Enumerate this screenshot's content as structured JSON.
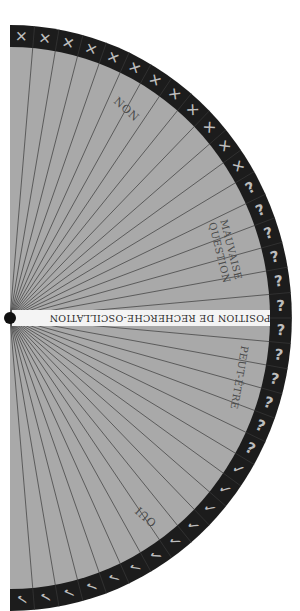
{
  "geometry": {
    "center_x": 10,
    "center_y": 318,
    "outer_rx": 282,
    "outer_ry": 293,
    "band_width": 22,
    "segments": 36
  },
  "colors": {
    "face": "#a9a9a9",
    "band": "#1c1c1c",
    "ray": "#3a3a3a",
    "symbol": "#bdbdbd",
    "strip": "#f4f4f4",
    "pivot": "#111111",
    "label": "#4a4a4a"
  },
  "zones": [
    {
      "name": "non",
      "symbol": "✕",
      "symbol_name": "x-icon",
      "count": 12
    },
    {
      "name": "mauvaise-question",
      "symbol": "?",
      "symbol_name": "question-mark-icon",
      "count": 6
    },
    {
      "name": "peut-etre",
      "symbol": "?",
      "symbol_name": "question-mark-icon",
      "count": 6
    },
    {
      "name": "oui",
      "symbol": "✓",
      "symbol_name": "check-icon",
      "count": 12
    }
  ],
  "labels": {
    "non": "NON",
    "mauvaise_line1": "MAUVAISE",
    "mauvaise_line2": "QUESTION",
    "peut_etre": "PEUT-ÊTRE",
    "oui": "OUI"
  },
  "strip": {
    "text": "POSITION  DE  RECHERCHE-OSCILLATION"
  }
}
